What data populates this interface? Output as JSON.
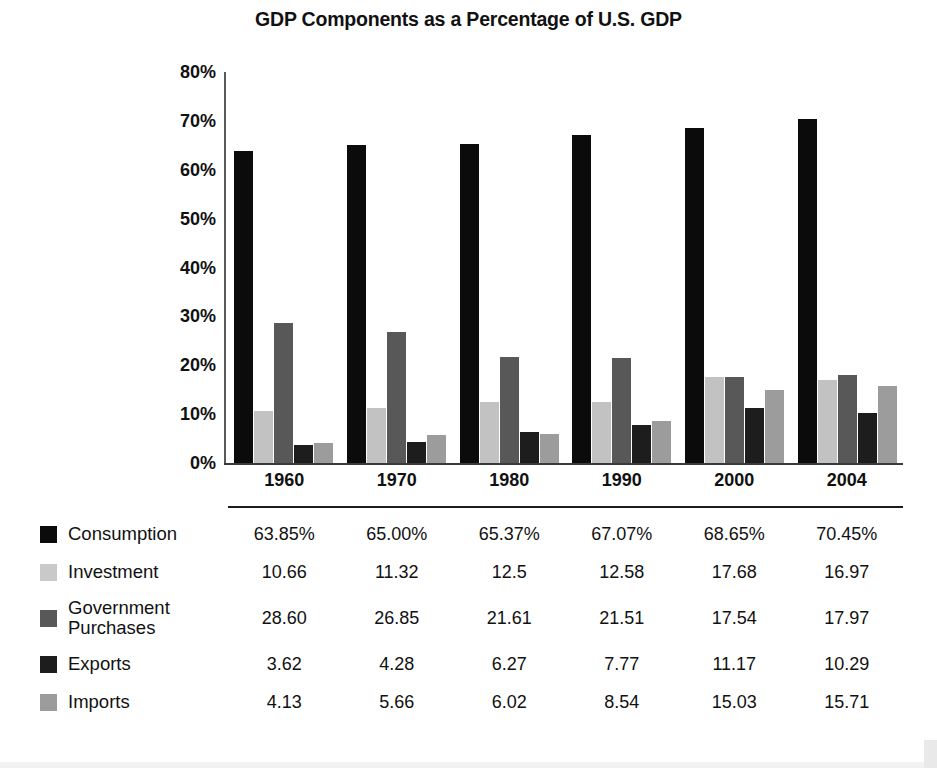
{
  "chart_data": {
    "type": "bar",
    "title": "GDP Components as a Percentage of U.S. GDP",
    "xlabel": "",
    "ylabel": "",
    "ylim": [
      0,
      80
    ],
    "grid": false,
    "legend_position": "bottom-left",
    "categories": [
      "1960",
      "1970",
      "1980",
      "1990",
      "2000",
      "2004"
    ],
    "ytick_labels": [
      "80%",
      "70%",
      "60%",
      "50%",
      "40%",
      "30%",
      "20%",
      "10%",
      "0%"
    ],
    "ytick_values": [
      80,
      70,
      60,
      50,
      40,
      30,
      20,
      10,
      0
    ],
    "series": [
      {
        "name": "Consumption",
        "color": "#0b0b0b",
        "values": [
          63.85,
          65.0,
          65.37,
          67.07,
          68.65,
          70.45
        ],
        "labels": [
          "63.85%",
          "65.00%",
          "65.37%",
          "67.07%",
          "68.65%",
          "70.45%"
        ]
      },
      {
        "name": "Investment",
        "color": "#c9c9c9",
        "values": [
          10.66,
          11.32,
          12.5,
          12.58,
          17.68,
          16.97
        ],
        "labels": [
          "10.66",
          "11.32",
          "12.5",
          "12.58",
          "17.68",
          "16.97"
        ]
      },
      {
        "name": "Government\nPurchases",
        "color": "#585858",
        "values": [
          28.6,
          26.85,
          21.61,
          21.51,
          17.54,
          17.97
        ],
        "labels": [
          "28.60",
          "26.85",
          "21.61",
          "21.51",
          "17.54",
          "17.97"
        ]
      },
      {
        "name": "Exports",
        "color": "#1d1d1d",
        "values": [
          3.62,
          4.28,
          6.27,
          7.77,
          11.17,
          10.29
        ],
        "labels": [
          "3.62",
          "4.28",
          "6.27",
          "7.77",
          "11.17",
          "10.29"
        ]
      },
      {
        "name": "Imports",
        "color": "#9c9c9c",
        "values": [
          4.13,
          5.66,
          6.02,
          8.54,
          15.03,
          15.71
        ],
        "labels": [
          "4.13",
          "5.66",
          "6.02",
          "8.54",
          "15.03",
          "15.71"
        ]
      }
    ]
  }
}
